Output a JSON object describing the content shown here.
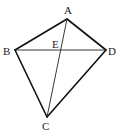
{
  "diagram": {
    "type": "geometry-figure",
    "stroke_color": "#111111",
    "points": {
      "A": {
        "x": 67,
        "y": 19
      },
      "B": {
        "x": 15,
        "y": 50
      },
      "C": {
        "x": 47,
        "y": 117
      },
      "D": {
        "x": 106,
        "y": 50
      },
      "E": {
        "x": 59,
        "y": 50
      }
    },
    "labels": {
      "A": "A",
      "B": "B",
      "C": "C",
      "D": "D",
      "E": "E"
    },
    "segments": [
      {
        "from": "A",
        "to": "B",
        "weight": "thick"
      },
      {
        "from": "A",
        "to": "D",
        "weight": "thick"
      },
      {
        "from": "B",
        "to": "C",
        "weight": "thick"
      },
      {
        "from": "D",
        "to": "C",
        "weight": "thick"
      },
      {
        "from": "B",
        "to": "D",
        "weight": "thin"
      },
      {
        "from": "A",
        "to": "C",
        "weight": "thin"
      }
    ]
  }
}
